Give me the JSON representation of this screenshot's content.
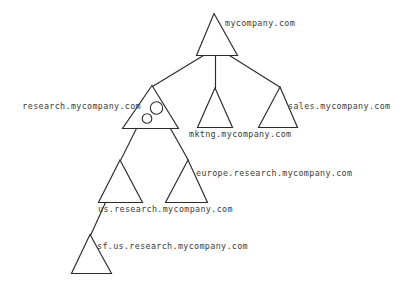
{
  "diagram": {
    "stroke_color": "#2b2b2b",
    "text_color": "#3b3b3b",
    "background_color": "#ffffff",
    "nodes": [
      {
        "id": "root",
        "label": "mycompany.com",
        "shape": "triangle",
        "label_position": "right"
      },
      {
        "id": "research",
        "label": "research.mycompany.com",
        "shape": "triangle-with-circles",
        "label_position": "left",
        "circles": 2
      },
      {
        "id": "mktng",
        "label": "mktng.mycompany.com",
        "shape": "triangle",
        "label_position": "below"
      },
      {
        "id": "sales",
        "label": "sales.mycompany.com",
        "shape": "triangle",
        "label_position": "right"
      },
      {
        "id": "us-research",
        "label": "us.research.mycompany.com",
        "shape": "triangle",
        "label_position": "below"
      },
      {
        "id": "europe-research",
        "label": "europe.research.mycompany.com",
        "shape": "triangle",
        "label_position": "right"
      },
      {
        "id": "sf-us-research",
        "label": "sf.us.research.mycompany.com",
        "shape": "triangle",
        "label_position": "right"
      }
    ],
    "edges": [
      {
        "from": "root",
        "to": "research"
      },
      {
        "from": "root",
        "to": "mktng"
      },
      {
        "from": "root",
        "to": "sales"
      },
      {
        "from": "research",
        "to": "us-research"
      },
      {
        "from": "research",
        "to": "europe-research"
      },
      {
        "from": "us-research",
        "to": "sf-us-research"
      }
    ]
  }
}
